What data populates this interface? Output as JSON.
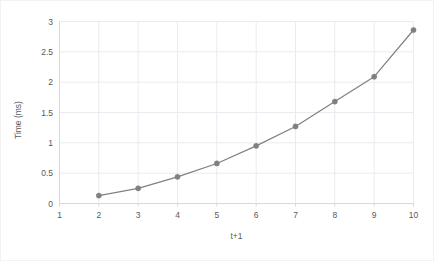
{
  "chart_data": {
    "type": "line",
    "title": "",
    "xlabel": "t+1",
    "ylabel": "Time (ms)",
    "x": [
      2,
      3,
      4,
      5,
      6,
      7,
      8,
      9,
      10
    ],
    "values": [
      0.13,
      0.25,
      0.44,
      0.66,
      0.95,
      1.27,
      1.68,
      2.09,
      2.86
    ],
    "series": [
      {
        "name": "Time",
        "values": [
          0.13,
          0.25,
          0.44,
          0.66,
          0.95,
          1.27,
          1.68,
          2.09,
          2.86
        ]
      }
    ],
    "xlim": [
      1,
      10
    ],
    "ylim": [
      0,
      3
    ],
    "x_ticks": [
      "1",
      "2",
      "3",
      "4",
      "5",
      "6",
      "7",
      "8",
      "9",
      "10"
    ],
    "y_ticks": [
      "0",
      "0.5",
      "1",
      "1.5",
      "2",
      "2.5",
      "3"
    ],
    "grid": true,
    "legend": "none",
    "colors": {
      "line": "#808080",
      "marker": "#808080",
      "grid": "#e8ecf0",
      "axis": "#d9d9d9",
      "text": "#595959",
      "border": "#f2f2f2",
      "background": "#ffffff"
    }
  }
}
